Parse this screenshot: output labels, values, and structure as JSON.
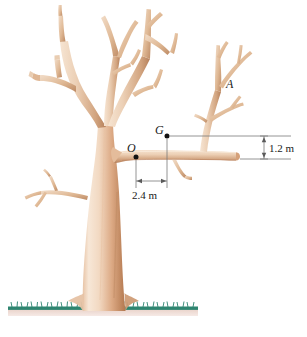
{
  "figure": {
    "background_color": "#ffffff"
  },
  "points": [
    {
      "id": "O",
      "label": "O",
      "description": "pivot point at trunk-branch junction",
      "x": 136,
      "y": 157
    },
    {
      "id": "G",
      "label": "G",
      "description": "center of gravity of branch",
      "x": 167,
      "y": 136
    },
    {
      "id": "A",
      "label": "A",
      "description": "upper right sub-branch",
      "x": 226,
      "y": 86
    }
  ],
  "dimensions": [
    {
      "id": "vertical",
      "label": "1.2 m",
      "value": 1.2,
      "unit": "m",
      "orientation": "vertical",
      "description": "vertical offset between G level and branch level"
    },
    {
      "id": "horizontal",
      "label": "2.4 m",
      "value": 2.4,
      "unit": "m",
      "orientation": "horizontal",
      "description": "horizontal distance from O to G"
    }
  ],
  "colors": {
    "bark_light": "#f7e6d5",
    "bark_mid": "#e0b493",
    "bark_dark": "#c08a64",
    "bark_shadow": "#a9714d",
    "grass": "#2e8570",
    "soil": "#e8cfc6",
    "annotation": "#1a1a1a",
    "dim_line": "#7a7a7a"
  },
  "ground": {
    "label": "ground-grass-strip"
  }
}
